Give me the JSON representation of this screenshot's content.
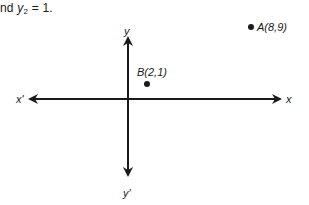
{
  "caption": {
    "prefix": "nd ",
    "var": "y",
    "sub": "2",
    "suffix": " = 1."
  },
  "diagram": {
    "type": "coordinate-plane",
    "axes": {
      "x_positive_label": "x",
      "x_negative_label": "x'",
      "y_positive_label": "y",
      "y_negative_label": "y'"
    },
    "points": [
      {
        "name": "A",
        "label": "A(8,9)",
        "x": 8,
        "y": 9
      },
      {
        "name": "B",
        "label": "B(2,1)",
        "x": 2,
        "y": 1
      }
    ],
    "colors": {
      "ink": "#1a1a1a",
      "background": "#ffffff"
    }
  }
}
